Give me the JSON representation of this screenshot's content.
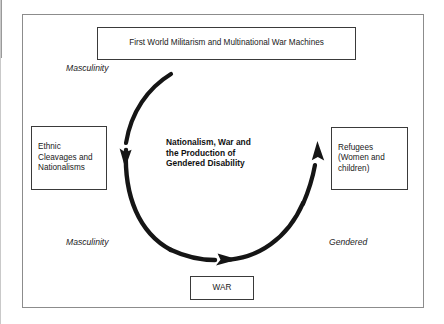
{
  "figure": {
    "nodes": {
      "top": {
        "name": "First World Militarism and Multinational War Machines",
        "text": "First World Militarism and Multinational War Machines"
      },
      "left": {
        "name": "Ethnic Cleavages and Nationalisms",
        "text": "Ethnic\nCleavages and\nNationalisms"
      },
      "right": {
        "name": "Refugees (Women and children)",
        "text": "Refugees\n(Women and\nchildren)"
      },
      "bottom": {
        "name": "WAR",
        "text": "WAR"
      }
    },
    "center_caption": "Nationalism, War and\nthe Production of\nGendered Disability",
    "annotations": {
      "masculinity_top": "Masculinity",
      "masculinity_bottom": "Masculinity",
      "gendered": "Gendered"
    },
    "arrow": {
      "name": "clockwise-cycle-arrow",
      "direction": "clockwise",
      "arrowhead_count": 3,
      "color": "#151515"
    },
    "colors": {
      "frame_border": "#8c8c8c",
      "box_border": "#3a3a3a",
      "text": "#1a1a1a",
      "arrow": "#151515",
      "background": "#ffffff"
    }
  }
}
